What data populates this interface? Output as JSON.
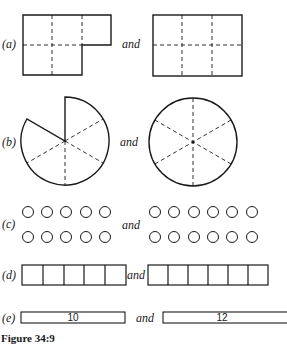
{
  "figure": {
    "caption": "Figure 34:9",
    "connector": "and",
    "parts": [
      {
        "label": "(a)",
        "left": "L-shape of 5 squares (3 top, 2 bottom)",
        "right": "rectangle of 6 squares (3x2)"
      },
      {
        "label": "(b)",
        "left": "circle with 5 of 6 sectors",
        "right": "circle divided into 6 sectors"
      },
      {
        "label": "(c)",
        "left_count": 10,
        "right_count": 12
      },
      {
        "label": "(d)",
        "left_cells": 5,
        "right_cells": 6
      },
      {
        "label": "(e)",
        "left_value": "10",
        "right_value": "12"
      }
    ]
  }
}
